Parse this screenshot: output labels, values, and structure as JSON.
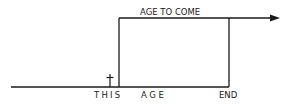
{
  "diagram": {
    "labels": {
      "top": "AGE TO COME",
      "this": "THIS",
      "age": "AGE",
      "end": "END"
    },
    "symbols": {
      "cross": "†"
    },
    "colors": {
      "line": "#1a1a1a",
      "background": "#ffffff"
    }
  }
}
